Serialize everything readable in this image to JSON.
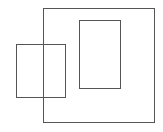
{
  "diagram": {
    "background": "#ffffff",
    "stroke_color": "#555555",
    "stroke_width": 1,
    "shapes": [
      {
        "id": "outer-square",
        "x": 43.5,
        "y": 8.5,
        "width": 111,
        "height": 114
      },
      {
        "id": "inner-rect",
        "x": 79.5,
        "y": 20.5,
        "width": 41,
        "height": 68
      },
      {
        "id": "left-rect",
        "x": 16.5,
        "y": 44.5,
        "width": 49,
        "height": 53
      }
    ]
  }
}
